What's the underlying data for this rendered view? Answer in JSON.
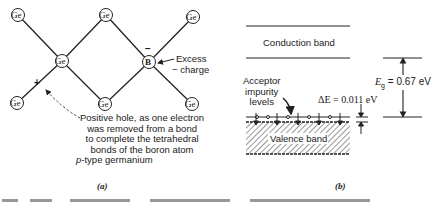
{
  "panel_a": {
    "atoms": [
      {
        "symbol": "Ge",
        "x": 18,
        "y": 15
      },
      {
        "symbol": "Ge",
        "x": 106,
        "y": 15
      },
      {
        "symbol": "Ge",
        "x": 193,
        "y": 17
      },
      {
        "symbol": "Ge",
        "x": 62,
        "y": 61
      },
      {
        "symbol": "B",
        "x": 149,
        "y": 62
      },
      {
        "symbol": "Ge",
        "x": 17,
        "y": 103
      },
      {
        "symbol": "Ge",
        "x": 105,
        "y": 104
      },
      {
        "symbol": "Ge",
        "x": 192,
        "y": 104
      }
    ],
    "boron_charge_sign": "−",
    "excess_charge_label_line1": "Excess",
    "excess_charge_label_line2": "− charge",
    "hole_sign": "+",
    "hole_note": [
      "Positive hole, as one electron",
      "was removed from a bond",
      "to complete the tetrahedral",
      "bonds of the boron atom"
    ],
    "type_label_italic": "p",
    "type_label_rest": "-type germanium",
    "caption_tag": "(a)"
  },
  "panel_b": {
    "conduction_band_label": "Conduction band",
    "valence_band_label": "Valence band",
    "acceptor_label": [
      "Acceptor",
      "impurity",
      "levels"
    ],
    "delta_e_label": "ΔE = 0.011 eV",
    "eg_symbol": "E",
    "eg_subscript": "g",
    "eg_value": " = 0.67 eV",
    "caption_tag": "(b)"
  }
}
